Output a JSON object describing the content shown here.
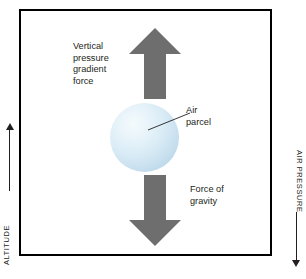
{
  "diagram": {
    "background_color": "#ffffff",
    "frame": {
      "name": "axis-frame",
      "border_color": "#000000"
    },
    "axes": {
      "left": {
        "label": "ALTITUDE",
        "arrow_direction": "up",
        "arrow_glyph": "↑"
      },
      "right": {
        "label": "AIR PRESSURE",
        "arrow_direction": "down",
        "arrow_glyph": "↓"
      }
    },
    "arrows": [
      {
        "name": "vertical-pressure-gradient-force-arrow",
        "direction": "up",
        "color": "#6e6e6e",
        "label": "Vertical\npressure\ngradient\nforce"
      },
      {
        "name": "force-of-gravity-arrow",
        "direction": "down",
        "color": "#6e6e6e",
        "label": "Force of\ngravity"
      }
    ],
    "parcel": {
      "name": "air-parcel-sphere",
      "label": "Air\nparcel",
      "highlight_color": "#f4fafd",
      "fill_color": "#cfe4f0",
      "edge_color": "#a8c6db"
    },
    "leader_line": {
      "name": "air-parcel-leader-line",
      "color": "#231f20"
    }
  }
}
